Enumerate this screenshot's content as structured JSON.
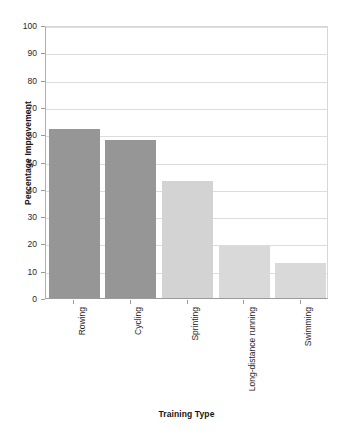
{
  "chart_data": {
    "type": "bar",
    "title": "",
    "xlabel": "Training Type",
    "ylabel": "Percentage Improvement",
    "categories": [
      "Rowing",
      "Cycling",
      "Sprinting",
      "Long-distance running",
      "Swimming"
    ],
    "values": [
      62,
      58,
      43,
      19,
      13
    ],
    "ylim": [
      0,
      100
    ],
    "yticks": [
      0,
      10,
      20,
      30,
      40,
      50,
      60,
      70,
      80,
      90,
      100
    ],
    "ytick_labels": [
      "0",
      "10",
      "20",
      "30",
      "40",
      "50",
      "60",
      "70",
      "80",
      "90",
      "100"
    ],
    "grid": true,
    "legend": "none",
    "bar_colors": [
      "#969696",
      "#969696",
      "#d3d3d3",
      "#d9d9d9",
      "#d9d9d9"
    ],
    "grid_color": "#dcdcdc",
    "axis_color": "#9a9a9a",
    "background_color": "#ffffff",
    "text_color": "#1f1f1f"
  }
}
